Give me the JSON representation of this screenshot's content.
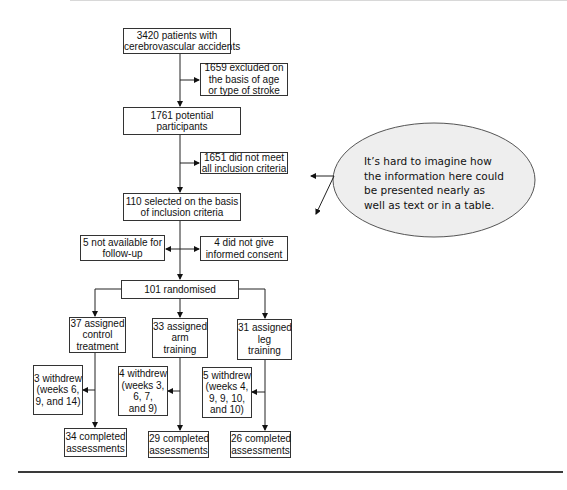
{
  "flowchart": {
    "screening": [
      "3420 patients with",
      "cerebrovascular accidents"
    ],
    "excluded_age_stroke": [
      "1659 excluded on",
      "the basis of age",
      "or type of stroke"
    ],
    "potential": [
      "1761 potential",
      "participants"
    ],
    "not_meet_criteria": [
      "1651 did not meet",
      "all inclusion criteria"
    ],
    "selected": [
      "110 selected on the basis",
      "of inclusion criteria"
    ],
    "not_available": [
      "5 not available for",
      "follow-up"
    ],
    "no_consent": [
      "4 did not give",
      "informed consent"
    ],
    "randomised": "101 randomised",
    "arms": [
      {
        "assigned": [
          "37 assigned",
          "control",
          "treatment"
        ],
        "withdrew": [
          "3 withdrew",
          "(weeks 6,",
          "9, and 14)"
        ],
        "completed": [
          "34 completed",
          "assessments"
        ]
      },
      {
        "assigned": [
          "33 assigned",
          "arm",
          "training"
        ],
        "withdrew": [
          "4 withdrew",
          "(weeks 3,",
          "6, 7,",
          "and 9)"
        ],
        "completed": [
          "29 completed",
          "assessments"
        ]
      },
      {
        "assigned": [
          "31 assigned",
          "leg",
          "training"
        ],
        "withdrew": [
          "5 withdrew",
          "(weeks 4,",
          "9, 9, 10,",
          "and 10)"
        ],
        "completed": [
          "26 completed",
          "assessments"
        ]
      }
    ]
  },
  "callout": {
    "lines": [
      "It’s hard to imagine how",
      "the information here could",
      "be presented nearly as",
      "well as text or in a table."
    ],
    "fill": "#eeeeee",
    "stroke": "#555555"
  }
}
